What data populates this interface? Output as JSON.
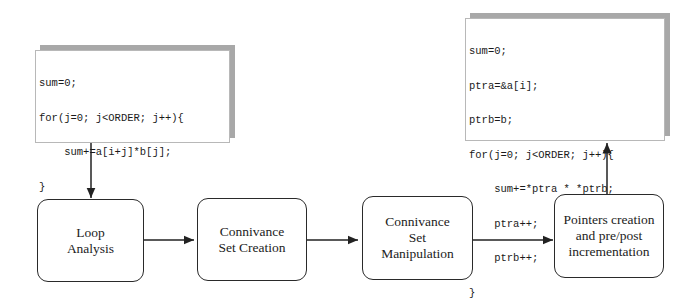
{
  "code_before": {
    "lines": [
      "sum=0;",
      "for(j=0; j<ORDER; j++){",
      "    sum+=a[i+j]*b[j];",
      "}"
    ]
  },
  "code_after": {
    "lines": [
      "sum=0;",
      "ptra=&a[i];",
      "ptrb=b;",
      "for(j=0; j<ORDER; j++){",
      "    sum+=*ptra * *ptrb;",
      "    ptra++;",
      "    ptrb++;",
      "}"
    ]
  },
  "nodes": [
    {
      "id": "loop-analysis",
      "label": "Loop\nAnalysis"
    },
    {
      "id": "connivance-set-creation",
      "label": "Connivance\nSet Creation"
    },
    {
      "id": "connivance-set-manipulation",
      "label": "Connivance\nSet\nManipulation"
    },
    {
      "id": "pointers-creation",
      "label": "Pointers creation\nand pre/post\nincrementation"
    }
  ],
  "edges": [
    {
      "from": "code-before",
      "to": "loop-analysis"
    },
    {
      "from": "loop-analysis",
      "to": "connivance-set-creation"
    },
    {
      "from": "connivance-set-creation",
      "to": "connivance-set-manipulation"
    },
    {
      "from": "connivance-set-manipulation",
      "to": "pointers-creation"
    },
    {
      "from": "pointers-creation",
      "to": "code-after"
    }
  ]
}
